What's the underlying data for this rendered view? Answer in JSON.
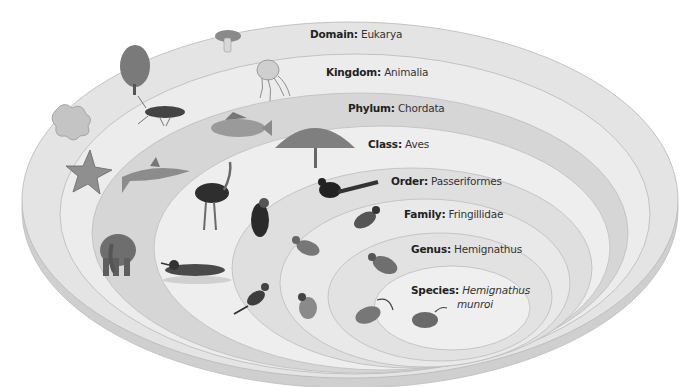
{
  "levels": [
    {
      "rank": "Domain:",
      "name": "Eukarya",
      "fill": "#e4e4e4"
    },
    {
      "rank": "Kingdom:",
      "name": "Animalia",
      "fill": "#ececec"
    },
    {
      "rank": "Phylum:",
      "name": "Chordata",
      "fill": "#d4d4d4"
    },
    {
      "rank": "Class:",
      "name": "Aves",
      "fill": "#efefef"
    },
    {
      "rank": "Order:",
      "name": "Passeriformes",
      "fill": "#dedede"
    },
    {
      "rank": "Family:",
      "name": "Fringillidae",
      "fill": "#e9e9e9"
    },
    {
      "rank": "Genus:",
      "name": "Hemignathus",
      "fill": "#e2e2e2"
    },
    {
      "rank": "Species:",
      "name_line1": "Hemignathus",
      "name_line2": "munroi",
      "fill": "#efefef"
    }
  ],
  "organisms": {
    "domain": [
      "mushroom",
      "tree",
      "amoeba-protist"
    ],
    "kingdom": [
      "jellyfish",
      "beetle",
      "sea-star"
    ],
    "phylum": [
      "perch-fish",
      "shark",
      "elephant"
    ],
    "class": [
      "peacock",
      "ostrich",
      "loon"
    ],
    "order": [
      "magpie",
      "parrot-like-bird",
      "kingfisher"
    ],
    "family": [
      "finch-1",
      "finch-2",
      "goldfinch"
    ],
    "genus": [
      "hemignathus-bird-1",
      "hemignathus-bird-2"
    ],
    "species": [
      "hemignathus-munroi"
    ]
  },
  "colors": {
    "stroke": "#b8b8b8",
    "text": "#222222"
  }
}
